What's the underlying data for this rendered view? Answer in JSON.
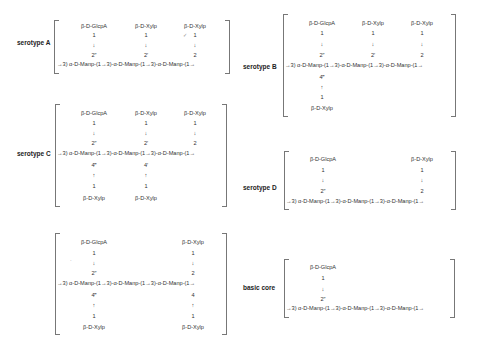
{
  "title_cut": "Figure 1. Repeating-unit structures of GXM serotypes",
  "panels": {
    "A": {
      "label": "serotype A",
      "top": [
        "β-D-GlcpA",
        "β-D-Xylp",
        "β-D-Xylp"
      ],
      "one": [
        "1",
        "1",
        "1"
      ],
      "down": [
        "↓",
        "↓",
        "↓"
      ],
      "pos": [
        "2″",
        "2′",
        "2"
      ],
      "chain": "→3) α-D-Manp-(1→3)-α-D-Manp-(1→3)-α-D-Manp-(1→",
      "mark": "✓"
    },
    "B": {
      "label": "serotype B",
      "top": [
        "β-D-GlcpA",
        "β-D-Xylp",
        "β-D-Xylp"
      ],
      "one": [
        "1",
        "1",
        "1"
      ],
      "down": [
        "↓",
        "↓",
        "↓"
      ],
      "pos": [
        "2″",
        "2′",
        "2"
      ],
      "chain": "→3) α-D-Manp-(1→3)-α-D-Manp-(1→3)-α-D-Manp-(1→",
      "bpos": [
        "4‴"
      ],
      "up": [
        "↑"
      ],
      "bone": [
        "1"
      ],
      "bottom": [
        "β-D-Xylp"
      ]
    },
    "C": {
      "label": "serotype C",
      "top": [
        "β-D-GlcpA",
        "β-D-Xylp",
        "β-D-Xylp"
      ],
      "one": [
        "1",
        "1",
        "1"
      ],
      "down": [
        "↓",
        "↓",
        "↓"
      ],
      "pos": [
        "2″",
        "2′",
        "2"
      ],
      "chain": "→3) α-D-Manp-(1→3)-α-D-Manp-(1→3)-α-D-Manp-(1→",
      "bpos": [
        "4‴",
        "4′"
      ],
      "up": [
        "↑",
        "↑"
      ],
      "bone": [
        "1",
        "1"
      ],
      "bottom": [
        "β-D-Xylp",
        "β-D-Xylp"
      ]
    },
    "D": {
      "label": "serotype D",
      "top": [
        "β-D-GlcpA",
        "β-D-Xylp"
      ],
      "one": [
        "1",
        "1"
      ],
      "down": [
        "↓",
        "↓"
      ],
      "pos": [
        "2″",
        "2"
      ],
      "chain": "→3) α-D-Manp-(1→3)-α-D-Manp-(1→3)-α-D-Manp-(1→"
    },
    "AD": {
      "label": "",
      "top": [
        "β-D-GlcpA",
        "β-D-Xylp"
      ],
      "one": [
        "1",
        "1"
      ],
      "down": [
        "↓",
        "↓"
      ],
      "pos": [
        "2″",
        "2"
      ],
      "chain": "→3) α-D-Manp-(1→3)-α-D-Manp-(1→3)-α-D-Manp-(1→",
      "bpos": [
        "4‴",
        "4"
      ],
      "up": [
        "↑",
        "↑"
      ],
      "bone": [
        "1",
        "1"
      ],
      "bottom": [
        "β-D-Xylp",
        "β-D-Xylp"
      ]
    },
    "core": {
      "label": "basic core",
      "top": [
        "β-D-GlcpA"
      ],
      "one": [
        "1"
      ],
      "down": [
        "↓"
      ],
      "pos": [
        "2″"
      ],
      "chain": "→3) α-D-Manp-(1→3)-α-D-Manp-(1→3)-α-D-Manp-(1→"
    }
  }
}
